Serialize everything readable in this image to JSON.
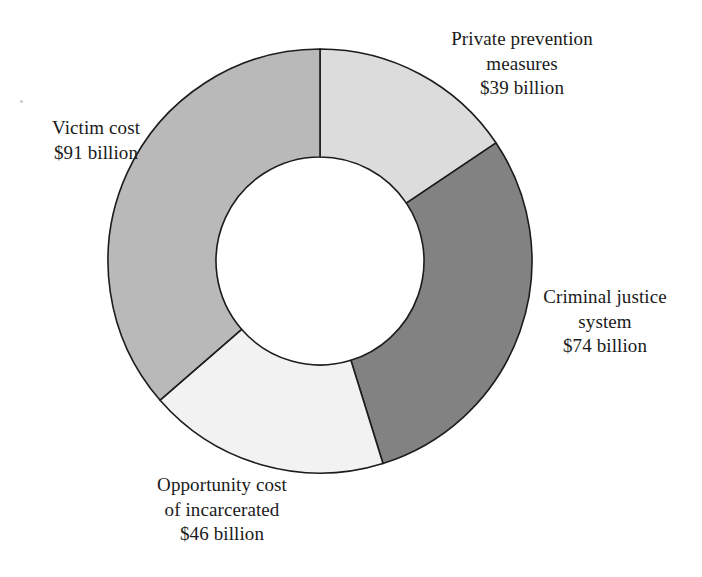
{
  "chart_data": {
    "type": "pie",
    "variant": "donut",
    "title": "",
    "subtitle": "",
    "xlabel": "",
    "ylabel": "",
    "units": "billions of US dollars",
    "total": 250,
    "start_angle_deg": 0,
    "direction": "clockwise",
    "grid": false,
    "legend_position": "callout-labels",
    "categories": [
      "Private prevention measures",
      "Criminal justice system",
      "Opportunity cost of incarcerated",
      "Victim cost"
    ],
    "values": [
      39,
      74,
      46,
      91
    ],
    "slices": [
      {
        "name": "Private prevention measures",
        "value": 39,
        "value_label": "$39 billion",
        "percent": 15.6,
        "color": "#dcdcdc"
      },
      {
        "name": "Criminal justice system",
        "value": 74,
        "value_label": "$74 billion",
        "percent": 29.6,
        "color": "#828282"
      },
      {
        "name": "Opportunity cost of incarcerated",
        "value": 46,
        "value_label": "$46 billion",
        "percent": 18.4,
        "color": "#f2f2f2"
      },
      {
        "name": "Victim cost",
        "value": 91,
        "value_label": "$91 billion",
        "percent": 36.4,
        "color": "#b9b9b9"
      }
    ]
  },
  "geometry": {
    "center_x": 320,
    "center_y": 261,
    "outer_radius": 212,
    "inner_radius": 104,
    "hole_fill": "#ffffff",
    "stroke_color": "#1c1c1c"
  },
  "callouts": {
    "private_prevention": {
      "line1": "Private prevention",
      "line2": "measures",
      "line3": "$39 billion"
    },
    "criminal_justice": {
      "line1": "Criminal justice",
      "line2": "system",
      "line3": "$74 billion"
    },
    "opportunity_cost": {
      "line1": "Opportunity cost",
      "line2": "of incarcerated",
      "line3": "$46 billion"
    },
    "victim_cost": {
      "line1": "Victim cost",
      "line2": "$91 billion",
      "line3": ""
    }
  }
}
